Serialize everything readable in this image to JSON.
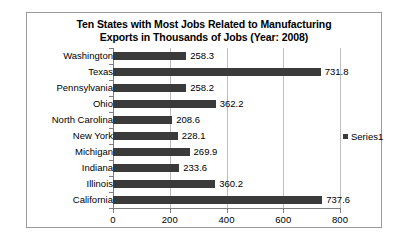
{
  "chart_data": {
    "type": "bar",
    "orientation": "horizontal",
    "title": "Ten States with Most Jobs Related to Manufacturing Exports in Thousands of Jobs (Year: 2008)",
    "title_lines": [
      "Ten States with Most Jobs Related to Manufacturing",
      "Exports in Thousands of Jobs (Year: 2008)"
    ],
    "categories": [
      "Washington",
      "Texas",
      "Pennsylvania",
      "Ohio",
      "North Carolina",
      "New York",
      "Michigan",
      "Indiana",
      "Illinois",
      "California"
    ],
    "values": [
      258.3,
      731.8,
      258.2,
      362.2,
      208.6,
      228.1,
      269.9,
      233.6,
      360.2,
      737.6
    ],
    "data_labels": [
      "258.3",
      "731.8",
      "258.2",
      "362.2",
      "208.6",
      "228.1",
      "269.9",
      "233.6",
      "360.2",
      "737.6"
    ],
    "series": [
      {
        "name": "Series1",
        "color": "#3a3a3a",
        "values": [
          258.3,
          731.8,
          258.2,
          362.2,
          208.6,
          228.1,
          269.9,
          233.6,
          360.2,
          737.6
        ]
      }
    ],
    "xlabel": "",
    "ylabel": "",
    "xlim": [
      0,
      800
    ],
    "xticks": [
      0,
      200,
      400,
      600,
      800
    ],
    "xtick_labels": [
      "0",
      "200",
      "400",
      "600",
      "800"
    ],
    "grid": "vertical",
    "legend": {
      "position": "right",
      "entries": [
        "Series1"
      ]
    },
    "colors": {
      "bar": "#3a3a3a",
      "gridline": "#bfbfbf",
      "axis": "#808080",
      "border": "#9a9a9a",
      "background": "#ffffff",
      "text": "#000000"
    }
  }
}
